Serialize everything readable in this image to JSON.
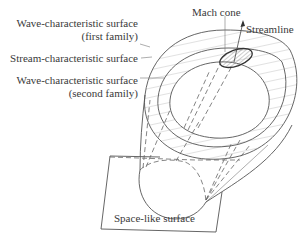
{
  "diagram": {
    "type": "characteristic-surfaces-illustration",
    "labels": {
      "wave_first_line1": "Wave-characteristic surface",
      "wave_first_line2": "(first family)",
      "stream": "Stream-characteristic surface",
      "wave_second_line1": "Wave-characteristic surface",
      "wave_second_line2": "(second family)",
      "mach_cone": "Mach cone",
      "streamline": "Streamline",
      "space_like": "Space-like surface"
    },
    "colors": {
      "background": "#ffffff",
      "ink": "#3a3a3a",
      "line": "#555555"
    }
  }
}
